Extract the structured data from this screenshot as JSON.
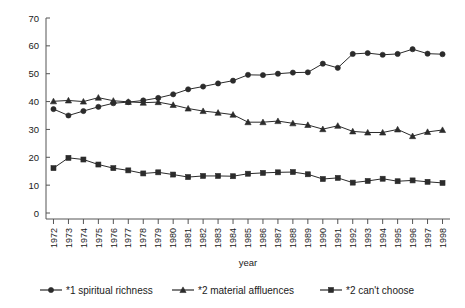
{
  "chart_data": {
    "type": "line",
    "title": "",
    "xlabel": "year",
    "ylabel": "",
    "ylim": [
      0,
      70
    ],
    "yticks": [
      0,
      10,
      20,
      30,
      40,
      50,
      60,
      70
    ],
    "grid": false,
    "legend_position": "bottom",
    "categories": [
      "1972",
      "1973",
      "1974",
      "1975",
      "1976",
      "1977",
      "1978",
      "1979",
      "1980",
      "1981",
      "1982",
      "1983",
      "1984",
      "1985",
      "1986",
      "1987",
      "1988",
      "1989",
      "1990",
      "1991",
      "1992",
      "1993",
      "1994",
      "1995",
      "1996",
      "1997",
      "1998"
    ],
    "series": [
      {
        "name": "*1 spiritual richness",
        "marker": "circle",
        "color": "#2b2b2b",
        "values": [
          37.3,
          35.0,
          36.6,
          38.1,
          39.4,
          39.8,
          40.4,
          41.3,
          42.6,
          44.4,
          45.4,
          46.5,
          47.5,
          49.6,
          49.5,
          50.0,
          50.4,
          50.5,
          53.6,
          52.1,
          57.1,
          57.4,
          56.8,
          57.1,
          58.8,
          57.2,
          57.0
        ]
      },
      {
        "name": "*2 material affluences",
        "marker": "triangle",
        "color": "#2b2b2b",
        "values": [
          40.1,
          40.4,
          40.0,
          41.4,
          40.3,
          39.9,
          39.6,
          39.8,
          38.8,
          37.5,
          36.6,
          36.0,
          35.3,
          32.6,
          32.6,
          33.0,
          32.2,
          31.6,
          30.1,
          31.3,
          29.3,
          28.9,
          28.9,
          30.0,
          27.6,
          29.1,
          29.8
        ]
      },
      {
        "name": "*2 can't choose",
        "marker": "square",
        "color": "#2b2b2b",
        "values": [
          16.1,
          19.8,
          19.2,
          17.4,
          16.1,
          15.3,
          14.2,
          14.6,
          13.8,
          12.9,
          13.3,
          13.3,
          13.2,
          14.1,
          14.4,
          14.6,
          14.7,
          13.9,
          12.2,
          12.6,
          10.9,
          11.5,
          12.3,
          11.4,
          11.7,
          11.2,
          10.8
        ]
      }
    ]
  },
  "legend": {
    "items": [
      {
        "label": "*1 spiritual richness",
        "marker": "circle"
      },
      {
        "label": "*2 material affluences",
        "marker": "triangle"
      },
      {
        "label": "*2 can't choose",
        "marker": "square"
      }
    ]
  }
}
